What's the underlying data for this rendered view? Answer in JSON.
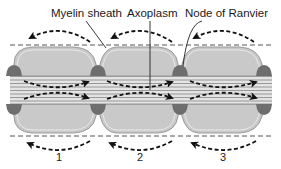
{
  "diagram": {
    "labels": {
      "myelin_sheath": "Myelin sheath",
      "axoplasm": "Axoplasm",
      "node_of_ranvier": "Node of Ranvier"
    },
    "segment_numbers": [
      "1",
      "2",
      "3"
    ],
    "colors": {
      "myelin_fill": "#c9c9c9",
      "myelin_outline": "#8a8a8a",
      "node_fill": "#6e6e6e",
      "axon_line": "#8f8f8f",
      "axon_fill": "#e4e4e4",
      "arrow": "#111111",
      "membrane_dashed_line": "#555555"
    }
  }
}
